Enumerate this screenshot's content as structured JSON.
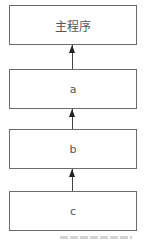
{
  "diagram": {
    "type": "call-chain",
    "nodes": [
      {
        "id": "main",
        "label": "主程序"
      },
      {
        "id": "a",
        "label": "a"
      },
      {
        "id": "b",
        "label": "b"
      },
      {
        "id": "c",
        "label": "c"
      }
    ],
    "edges": [
      {
        "from": "a",
        "to": "main"
      },
      {
        "from": "b",
        "to": "a"
      },
      {
        "from": "c",
        "to": "b"
      }
    ],
    "colors": {
      "border": "#6b6b6b",
      "text": "#555555",
      "arrow": "#222222"
    }
  }
}
